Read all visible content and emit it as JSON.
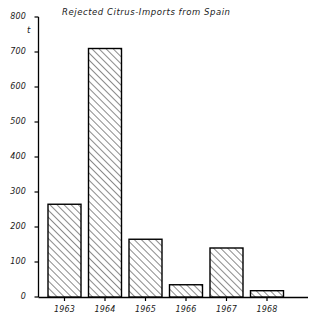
{
  "chart_data": {
    "type": "bar",
    "title": "Rejected  Citrus-Imports  from  Spain",
    "xlabel": "",
    "ylabel": "t",
    "unit": "t",
    "categories": [
      "1963",
      "1964",
      "1965",
      "1966",
      "1967",
      "1968"
    ],
    "values": [
      265,
      710,
      165,
      35,
      140,
      18
    ],
    "series": [
      {
        "name": "Rejected Citrus-Imports from Spain",
        "values": [
          265,
          710,
          165,
          35,
          140,
          18
        ]
      }
    ],
    "ylim": [
      0,
      800
    ],
    "ytick_values": [
      0,
      100,
      200,
      300,
      400,
      500,
      600,
      700,
      800
    ],
    "ytick_labels": [
      "0",
      "100",
      "200",
      "300",
      "400",
      "500",
      "600",
      "700",
      "800"
    ],
    "grid": false,
    "legend": false,
    "legend_position": "none",
    "bar_fill": "#ffffff",
    "bar_edge": "#000000",
    "bar_hatch": "diagonal-up",
    "axis_color": "#000000",
    "background": "#ffffff",
    "text_color": "#1a1a1a"
  }
}
